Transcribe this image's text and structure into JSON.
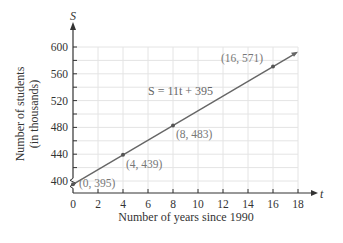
{
  "chart_data": {
    "type": "line",
    "title": "",
    "xlabel": "Number of years since 1990",
    "ylabel_line1": "Number of students",
    "ylabel_line2": "(in thousands)",
    "x_var": "t",
    "y_var": "S",
    "equation": "S = 11t + 395",
    "xlim": [
      0,
      18
    ],
    "ylim": [
      400,
      600
    ],
    "y_axis_break": true,
    "x_ticks": [
      0,
      2,
      4,
      6,
      8,
      10,
      12,
      14,
      16,
      18
    ],
    "y_ticks": [
      400,
      440,
      480,
      520,
      560,
      600
    ],
    "grid": true,
    "series": [
      {
        "name": "S = 11t + 395",
        "x": [
          0,
          18
        ],
        "y": [
          395,
          593
        ],
        "color": "#666666"
      }
    ],
    "points": [
      {
        "x": 0,
        "y": 395,
        "label": "(0, 395)"
      },
      {
        "x": 4,
        "y": 439,
        "label": "(4, 439)"
      },
      {
        "x": 8,
        "y": 483,
        "label": "(8, 483)"
      },
      {
        "x": 16,
        "y": 571,
        "label": "(16, 571)"
      }
    ]
  },
  "colors": {
    "axis": "#333333",
    "grid": "#e4e4e4",
    "line": "#666666",
    "point": "#555555"
  }
}
